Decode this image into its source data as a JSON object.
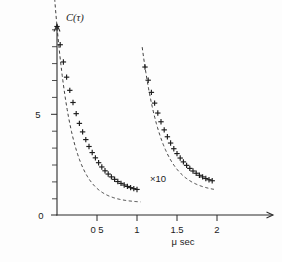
{
  "figure": {
    "background_color": "#fdfdfd",
    "ink_color": "#1c1c1c"
  },
  "labels": {
    "ylabel": "C(τ)",
    "xlabel": "μ sec",
    "annotation_scale": "×10",
    "ytick_5": "5",
    "ytick_0": "0",
    "xtick_05": "0 5",
    "xtick_1": "1",
    "xtick_15": "1.5",
    "xtick_2": "2"
  },
  "chart_data": {
    "type": "scatter",
    "title": "",
    "xlabel": "μ sec",
    "ylabel": "C(τ)",
    "xlim": [
      0,
      2.2
    ],
    "ylim": [
      0,
      10.5
    ],
    "grid": false,
    "legend": "none",
    "axis_style": "L-shaped spines with arrow heads",
    "xticks_labeled": [
      0.5,
      1.0,
      1.5,
      2.0
    ],
    "xtick_labels": [
      "0 5",
      "1",
      "1.5",
      "2"
    ],
    "yticks_labeled": [
      0,
      5
    ],
    "ytick_labels": [
      "0",
      "5"
    ],
    "ytick_minor_count": 11,
    "annotations": [
      {
        "text": "×10",
        "x": 1.18,
        "y": 1.55
      }
    ],
    "marker_symbol": "plus",
    "fit_line_style": "dashed",
    "series": [
      {
        "name": "correlation-decay-run-1",
        "x": [
          0.0,
          0.04,
          0.08,
          0.12,
          0.16,
          0.2,
          0.24,
          0.28,
          0.32,
          0.36,
          0.4,
          0.44,
          0.48,
          0.52,
          0.56,
          0.6,
          0.64,
          0.68,
          0.72,
          0.76,
          0.8,
          0.84,
          0.88,
          0.92,
          0.96,
          1.0
        ],
        "y": [
          9.3,
          8.4,
          7.55,
          6.8,
          6.15,
          5.55,
          5.0,
          4.52,
          4.1,
          3.72,
          3.38,
          3.08,
          2.82,
          2.58,
          2.37,
          2.18,
          2.02,
          1.88,
          1.76,
          1.65,
          1.56,
          1.48,
          1.41,
          1.35,
          1.3,
          1.26
        ],
        "fit": {
          "model": "exponential",
          "amplitude": 9.3,
          "decay_rate": 5.0,
          "offset": 0.6
        }
      },
      {
        "name": "correlation-decay-run-2-scaled-x10",
        "x": [
          1.1,
          1.14,
          1.18,
          1.22,
          1.26,
          1.3,
          1.34,
          1.38,
          1.42,
          1.46,
          1.5,
          1.54,
          1.58,
          1.62,
          1.66,
          1.7,
          1.74,
          1.78,
          1.82,
          1.86,
          1.9,
          1.94
        ],
        "y": [
          7.3,
          6.65,
          6.05,
          5.52,
          5.03,
          4.6,
          4.2,
          3.86,
          3.55,
          3.27,
          3.03,
          2.81,
          2.62,
          2.45,
          2.3,
          2.17,
          2.06,
          1.96,
          1.88,
          1.8,
          1.74,
          1.69
        ],
        "fit": {
          "model": "exponential",
          "amplitude": 7.3,
          "decay_rate": 4.2,
          "offset": 1.1
        }
      }
    ]
  }
}
